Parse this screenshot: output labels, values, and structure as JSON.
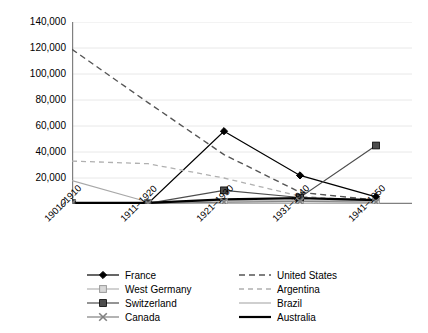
{
  "chart_data": {
    "type": "line",
    "title": "",
    "subtitle": "",
    "xlabel": "",
    "ylabel": "",
    "categories": [
      "1901–1910",
      "1911–1920",
      "1921–1930",
      "1931–1940",
      "1941–1950"
    ],
    "ylim": [
      0,
      140000
    ],
    "ytick_values": [
      0,
      20000,
      40000,
      60000,
      80000,
      100000,
      120000,
      140000
    ],
    "ytick_labels": [
      "0",
      "20,000",
      "40,000",
      "60,000",
      "80,000",
      "100,000",
      "120,000",
      "140,000"
    ],
    "grid": true,
    "grid_axis": "y",
    "legend_position": "bottom",
    "legend_columns": 2,
    "series": [
      {
        "name": "France",
        "values": [
          500,
          400,
          56000,
          22000,
          5500
        ],
        "marker": "diamond",
        "line_style": "solid",
        "color": "#000000",
        "legend_column": "left"
      },
      {
        "name": "West Germany",
        "values": [
          300,
          300,
          300,
          300,
          300
        ],
        "marker": "square-open",
        "line_style": "solid",
        "color": "#b3b3b3",
        "legend_column": "left"
      },
      {
        "name": "Switzerland",
        "values": [
          600,
          500,
          10500,
          5000,
          45000
        ],
        "marker": "square",
        "line_style": "solid",
        "color": "#4d4d4d",
        "legend_column": "left"
      },
      {
        "name": "Canada",
        "values": [
          400,
          400,
          1500,
          2000,
          1500
        ],
        "marker": "cross",
        "line_style": "solid",
        "color": "#808080",
        "legend_column": "left"
      },
      {
        "name": "United States",
        "values": [
          119000,
          78000,
          38000,
          9000,
          3000
        ],
        "marker": "none",
        "line_style": "dashed",
        "color": "#555555",
        "legend_column": "right"
      },
      {
        "name": "Argentina",
        "values": [
          33000,
          31000,
          20000,
          6000,
          2000
        ],
        "marker": "none",
        "line_style": "dashed-light",
        "color": "#b0b0b0",
        "legend_column": "right"
      },
      {
        "name": "Brazil",
        "values": [
          18000,
          1500,
          2500,
          2500,
          2500
        ],
        "marker": "none",
        "line_style": "solid-light",
        "color": "#a8a8a8",
        "legend_column": "right"
      },
      {
        "name": "Australia",
        "values": [
          800,
          800,
          3500,
          4500,
          3000
        ],
        "marker": "none",
        "line_style": "solid-heavy",
        "color": "#000000",
        "legend_column": "right"
      }
    ]
  },
  "legend": {
    "left_column": [
      "France",
      "West Germany",
      "Switzerland",
      "Canada"
    ],
    "right_column": [
      "United States",
      "Argentina",
      "Brazil",
      "Australia"
    ]
  },
  "colors": {
    "axis": "#808080",
    "grid": "#e8e8e8",
    "text": "#000000",
    "background": "#ffffff"
  }
}
